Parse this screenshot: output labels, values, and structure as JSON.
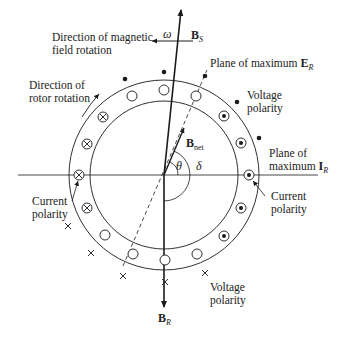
{
  "diagram": {
    "labels": {
      "mag_field_rotation": [
        "Direction of magnetic",
        "field rotation"
      ],
      "rotor_rotation": [
        "Direction of",
        "rotor rotation"
      ],
      "omega": "ω",
      "bs_main": "B",
      "bs_sub": "S",
      "plane_er_text": "Plane of maximum ",
      "plane_er_vec": "E",
      "plane_er_sub": "R",
      "voltage_polarity_top": [
        "Voltage",
        "polarity"
      ],
      "plane_ir_line1": "Plane of",
      "plane_ir_text": "maximum ",
      "plane_ir_vec": "I",
      "plane_ir_sub": "R",
      "current_polarity_right": [
        "Current",
        "polarity"
      ],
      "current_polarity_left": [
        "Current",
        "polarity"
      ],
      "bnet_main": "B",
      "bnet_sub": "net",
      "theta": "θ",
      "delta": "δ",
      "voltage_polarity_bottom": [
        "Voltage",
        "polarity"
      ],
      "br_main": "B",
      "br_sub": "R"
    },
    "conductor_types": {
      "dot": "current out of page (⊙)",
      "cross": "current into page (⊗)",
      "empty": "no current (○)"
    },
    "colors": {
      "line": "#1a1a1a",
      "text": "#222222",
      "background": "#ffffff"
    }
  }
}
